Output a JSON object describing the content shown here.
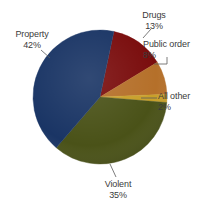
{
  "chart_data": {
    "type": "pie",
    "title": "",
    "subtitle": "",
    "xlabel": "",
    "ylabel": "",
    "legend_position": "none",
    "grid": false,
    "labels_outside": true,
    "background_color": "#ffffff",
    "categories": [
      "Drugs",
      "Public order",
      "All other",
      "Violent",
      "Property"
    ],
    "values": [
      13,
      8,
      2,
      35,
      42
    ],
    "value_unit": "%",
    "total": 100,
    "start_angle_deg": 12,
    "direction": "clockwise",
    "slices": [
      {
        "name": "Drugs",
        "value": 13,
        "value_label": "13%",
        "color": "#7a0d0d",
        "start_angle_deg": 12,
        "end_angle_deg": 58.8
      },
      {
        "name": "Public order",
        "value": 8,
        "value_label": "8%",
        "color": "#b5702a",
        "start_angle_deg": 58.8,
        "end_angle_deg": 87.6
      },
      {
        "name": "All other",
        "value": 2,
        "value_label": "2%",
        "color": "#c8a02a",
        "start_angle_deg": 87.6,
        "end_angle_deg": 94.8
      },
      {
        "name": "Violent",
        "value": 35,
        "value_label": "35%",
        "color": "#4a5218",
        "start_angle_deg": 94.8,
        "end_angle_deg": 220.8
      },
      {
        "name": "Property",
        "value": 42,
        "value_label": "42%",
        "color": "#1a3565",
        "start_angle_deg": 220.8,
        "end_angle_deg": 372
      }
    ]
  },
  "labels": {
    "drugs": {
      "name": "Drugs",
      "percent": "13%"
    },
    "public_order": {
      "name": "Public order",
      "percent": "8%"
    },
    "all_other": {
      "name": "All other",
      "percent": "2%"
    },
    "violent": {
      "name": "Violent",
      "percent": "35%"
    },
    "property": {
      "name": "Property",
      "percent": "42%"
    }
  },
  "geometry": {
    "center_x": 100,
    "center_y": 97,
    "radius": 67
  },
  "colors": {
    "drugs": "#7a0d0d",
    "public_order": "#b5702a",
    "all_other": "#c8a02a",
    "violent": "#4a5218",
    "property": "#1a3565",
    "leader_line": "#5a5a5a",
    "label_text": "#3b3b3b",
    "background": "#ffffff"
  }
}
